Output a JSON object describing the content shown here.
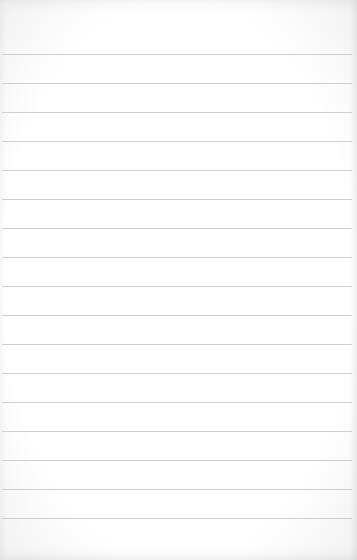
{
  "page": {
    "type": "lined-paper",
    "background_color": "#ffffff",
    "line_color": "#cfcfcf",
    "line_count": 17,
    "first_line_y": 54,
    "line_spacing": 29,
    "text": ""
  }
}
